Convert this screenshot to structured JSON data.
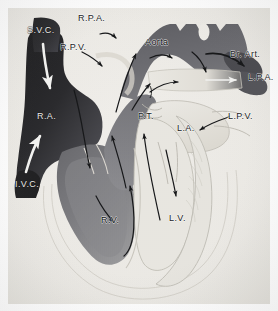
{
  "figure": {
    "width": 278,
    "height": 311,
    "background_color": "#ffffff",
    "paper_tone": "#eceae6"
  },
  "palette": {
    "deoxygenated_dark": "#2a2a2c",
    "deoxygenated_mid": "#6f6f72",
    "oxygenated_light": "#e4e2dc",
    "myocardium_outline": "#b9b6ae",
    "arrow_dark": "#17181a",
    "arrow_light": "#f2f2f0",
    "label_dark": "#17181a",
    "label_light": "#e9e9e7"
  },
  "labels": [
    {
      "id": "svc",
      "text": "S.V.C.",
      "x": 27,
      "y": 26,
      "tone": "onDark",
      "full_name": "superior vena cava"
    },
    {
      "id": "rpa",
      "text": "R.P.A.",
      "x": 78,
      "y": 14,
      "tone": "light",
      "full_name": "right pulmonary artery"
    },
    {
      "id": "rpv",
      "text": "R.P.V.",
      "x": 60,
      "y": 43,
      "tone": "light",
      "full_name": "right pulmonary vein"
    },
    {
      "id": "aorta",
      "text": "Aorta",
      "x": 145,
      "y": 38,
      "tone": "onMid",
      "full_name": "aorta"
    },
    {
      "id": "brart",
      "text": "Br. Art.",
      "x": 230,
      "y": 50,
      "tone": "light",
      "full_name": "brachiocephalic artery"
    },
    {
      "id": "lpa",
      "text": "L.P.A.",
      "x": 248,
      "y": 73,
      "tone": "light",
      "full_name": "left pulmonary artery"
    },
    {
      "id": "pt",
      "text": "P.T.",
      "x": 138,
      "y": 112,
      "tone": "light",
      "full_name": "pulmonary trunk"
    },
    {
      "id": "lpv",
      "text": "L.P.V.",
      "x": 228,
      "y": 112,
      "tone": "light",
      "full_name": "left pulmonary vein"
    },
    {
      "id": "la",
      "text": "L.A.",
      "x": 177,
      "y": 124,
      "tone": "light",
      "full_name": "left atrium"
    },
    {
      "id": "ra",
      "text": "R.A.",
      "x": 37,
      "y": 112,
      "tone": "onDark",
      "full_name": "right atrium"
    },
    {
      "id": "ivc",
      "text": "I.V.C.",
      "x": 15,
      "y": 180,
      "tone": "onDark",
      "full_name": "inferior vena cava"
    },
    {
      "id": "rv",
      "text": "R.V.",
      "x": 101,
      "y": 216,
      "tone": "onMid",
      "full_name": "right ventricle"
    },
    {
      "id": "lv",
      "text": "L.V.",
      "x": 169,
      "y": 214,
      "tone": "light",
      "full_name": "left ventricle"
    }
  ],
  "flow_arrows": [
    {
      "id": "svc-inflow",
      "color": "light",
      "description": "blood descending from superior vena cava into right atrium"
    },
    {
      "id": "ivc-inflow",
      "color": "light",
      "description": "blood ascending from inferior vena cava into right atrium"
    },
    {
      "id": "ra-to-rv",
      "color": "dark",
      "description": "right atrium through tricuspid valve into right ventricle"
    },
    {
      "id": "rv-apex-loop",
      "color": "dark",
      "description": "flow sweeping through right ventricular cavity toward apex"
    },
    {
      "id": "rv-to-pt",
      "color": "dark",
      "description": "right ventricle into pulmonary trunk"
    },
    {
      "id": "pt-to-rpa",
      "color": "dark",
      "description": "pulmonary trunk to right pulmonary artery"
    },
    {
      "id": "pt-to-lpa",
      "color": "dark",
      "description": "pulmonary trunk to left pulmonary artery"
    },
    {
      "id": "rpv-inflow",
      "color": "dark",
      "description": "right pulmonary vein entering left atrium"
    },
    {
      "id": "lpv-inflow",
      "color": "dark",
      "description": "left pulmonary vein entering left atrium"
    },
    {
      "id": "la-to-lv",
      "color": "dark",
      "description": "left atrium through mitral valve into left ventricle"
    },
    {
      "id": "lv-to-aorta",
      "color": "dark",
      "description": "left ventricle into ascending aorta"
    },
    {
      "id": "aortic-arch",
      "color": "dark",
      "description": "flow along the aortic arch"
    },
    {
      "id": "arch-descend",
      "color": "dark",
      "description": "flow descending the aortic arch"
    },
    {
      "id": "arch-to-brart",
      "color": "dark",
      "description": "aortic arch into brachiocephalic artery"
    }
  ]
}
